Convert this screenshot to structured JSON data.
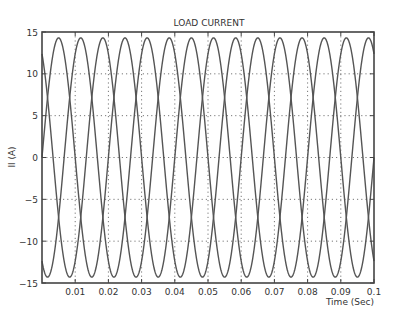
{
  "chart_data": {
    "type": "line",
    "title": "LOAD CURRENT",
    "xlabel": "Time (Sec)",
    "ylabel": "Il (A)",
    "xlim": [
      0,
      0.1
    ],
    "ylim": [
      -15,
      15
    ],
    "xticks": [
      0.01,
      0.02,
      0.03,
      0.04,
      0.05,
      0.06,
      0.07,
      0.08,
      0.09,
      0.1
    ],
    "xtick_labels": [
      "0.01",
      "0.02",
      "0.03",
      "0.04",
      "0.05",
      "0.06",
      "0.07",
      "0.08",
      "0.09",
      "0.1"
    ],
    "yticks": [
      -15,
      -10,
      -5,
      0,
      5,
      10,
      15
    ],
    "ytick_labels": [
      "−15",
      "−10",
      "−5",
      "0",
      "5",
      "10",
      "15"
    ],
    "grid": true,
    "grid_style": "dotted",
    "legend": null,
    "series": [
      {
        "name": "Phase A",
        "amplitude": 14.3,
        "frequency_hz": 50,
        "phase_deg": 0,
        "color": "#555555"
      },
      {
        "name": "Phase B",
        "amplitude": 14.3,
        "frequency_hz": 50,
        "phase_deg": -120,
        "color": "#555555"
      },
      {
        "name": "Phase C",
        "amplitude": 14.3,
        "frequency_hz": 50,
        "phase_deg": 120,
        "color": "#555555"
      }
    ],
    "sample_points": {
      "x": [
        0,
        0.0017,
        0.005,
        0.0083,
        0.0117,
        0.015,
        0.0183
      ],
      "Phase A": [
        0,
        7.2,
        14.3,
        7.2,
        -7.2,
        -14.3,
        -7.2
      ],
      "Phase B": [
        -12.4,
        -14.3,
        -7.2,
        7.2,
        14.3,
        7.2,
        -7.2
      ],
      "Phase C": [
        12.4,
        7.2,
        -7.2,
        -14.3,
        -7.2,
        7.2,
        14.3
      ]
    }
  },
  "layout": {
    "plot_left": 42,
    "plot_right": 374,
    "plot_top": 32,
    "plot_bottom": 283
  }
}
